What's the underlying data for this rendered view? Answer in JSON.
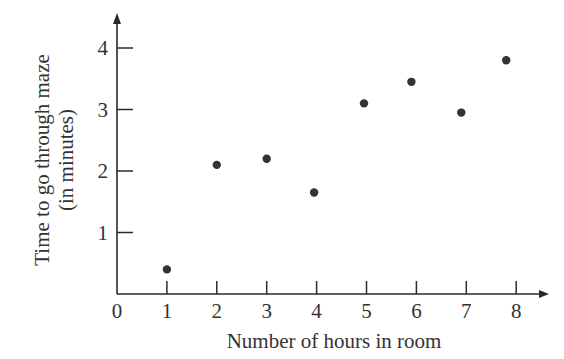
{
  "chart_data": {
    "type": "scatter",
    "title": "",
    "xlabel": "Number of hours in room",
    "ylabel_lines": [
      "Time to go through maze",
      "(in minutes)"
    ],
    "ylabel": "Time to go through maze (in minutes)",
    "xlim": [
      0,
      8.6
    ],
    "ylim": [
      0,
      4.6
    ],
    "x_ticks": [
      0,
      1,
      2,
      3,
      4,
      5,
      6,
      7,
      8
    ],
    "y_ticks": [
      1,
      2,
      3,
      4
    ],
    "grid": false,
    "legend": null,
    "series": [
      {
        "name": "observations",
        "points": [
          {
            "x": 1.0,
            "y": 0.4
          },
          {
            "x": 2.0,
            "y": 2.1
          },
          {
            "x": 3.0,
            "y": 2.2
          },
          {
            "x": 3.95,
            "y": 1.65
          },
          {
            "x": 4.95,
            "y": 3.1
          },
          {
            "x": 5.9,
            "y": 3.45
          },
          {
            "x": 6.9,
            "y": 2.95
          },
          {
            "x": 7.8,
            "y": 3.8
          }
        ]
      }
    ]
  },
  "style": {
    "axis_color": "#2a2a2a",
    "point_color": "#333333"
  }
}
